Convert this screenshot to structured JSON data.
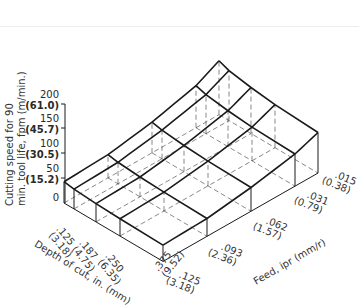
{
  "figure": {
    "y_axis": {
      "title_line1": "Cutting speed for 90",
      "title_line2": "min. tool life, fpm (m/min.)",
      "ticks": [
        {
          "value": "200",
          "metric": "(61.0)"
        },
        {
          "value": "150",
          "metric": "(45.7)"
        },
        {
          "value": "100",
          "metric": "(30.5)"
        },
        {
          "value": "50",
          "metric": "(15.2)"
        },
        {
          "value": "0",
          "metric": ""
        }
      ]
    },
    "depth_axis": {
      "title": "Depth of cut, in. (mm)",
      "ticks": [
        {
          "value": ".125",
          "metric": "(3.18)"
        },
        {
          "value": ".187",
          "metric": "(4.75)"
        },
        {
          "value": ".250",
          "metric": "(6.35)"
        },
        {
          "value": ".375",
          "metric": "(9.52)"
        }
      ]
    },
    "feed_axis": {
      "title": "Feed, ipr (mm/r)",
      "ticks": [
        {
          "value": ".125",
          "metric": "(3.18)"
        },
        {
          "value": ".093",
          "metric": "(2.36)"
        },
        {
          "value": ".062",
          "metric": "(1.57)"
        },
        {
          "value": ".031",
          "metric": "(0.79)"
        },
        {
          "value": ".015",
          "metric": "(0.38)"
        }
      ]
    },
    "colors": {
      "line": "#1a1a1a",
      "hidden": "#555555"
    }
  },
  "chart_data": {
    "type": "surface",
    "title": "",
    "zlabel": "Cutting speed for 90 min. tool life, fpm (m/min.)",
    "xlabel": "Depth of cut, in. (mm)",
    "ylabel": "Feed, ipr (mm/r)",
    "zlim": [
      0,
      200
    ],
    "depth_in": [
      0.1,
      0.125,
      0.187,
      0.25,
      0.375
    ],
    "feed_ipr": [
      0.125,
      0.093,
      0.062,
      0.031,
      0.015
    ],
    "speed_fpm": [
      [
        86,
        94,
        124,
        170,
        218
      ],
      [
        80,
        87,
        116,
        158,
        202
      ],
      [
        74,
        80,
        106,
        145,
        186
      ],
      [
        70,
        76,
        100,
        136,
        174
      ],
      [
        66,
        72,
        96,
        130,
        164
      ]
    ]
  }
}
